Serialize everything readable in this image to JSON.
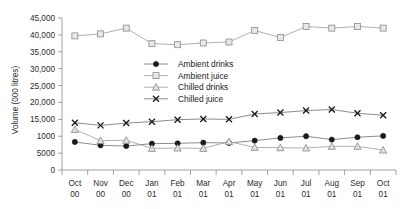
{
  "chart_data": {
    "type": "line",
    "title": "",
    "xlabel": "",
    "ylabel": "Volume (000 litres)",
    "categories": [
      "Oct 00",
      "Nov 00",
      "Dec 00",
      "Jan 01",
      "Feb 01",
      "Mar 01",
      "Apr 01",
      "May 01",
      "Jun 01",
      "Jul 01",
      "Aug 01",
      "Sep 01",
      "Oct 01"
    ],
    "category_lines": [
      [
        "Oct",
        "00"
      ],
      [
        "Nov",
        "00"
      ],
      [
        "Dec",
        "00"
      ],
      [
        "Jan",
        "01"
      ],
      [
        "Feb",
        "01"
      ],
      [
        "Mar",
        "01"
      ],
      [
        "Apr",
        "01"
      ],
      [
        "May",
        "01"
      ],
      [
        "Jun",
        "01"
      ],
      [
        "Jul",
        "01"
      ],
      [
        "Aug",
        "01"
      ],
      [
        "Sep",
        "01"
      ],
      [
        "Oct",
        "01"
      ]
    ],
    "ylim": [
      0,
      45000
    ],
    "ytick_values": [
      0,
      5000,
      10000,
      15000,
      20000,
      25000,
      30000,
      35000,
      40000,
      45000
    ],
    "ytick_labels": [
      "0",
      "5000",
      "1000",
      "15,000",
      "20,000",
      "25,000",
      "30,000",
      "35,000",
      "40,000",
      "45,000"
    ],
    "grid": false,
    "legend_position": "center",
    "series": [
      {
        "name": "Ambient drinks",
        "marker": "filled-circle",
        "color": "#1a1a1a",
        "line_color": "#6e6e6e",
        "values": [
          8300,
          7300,
          7100,
          7800,
          7900,
          8100,
          8000,
          8700,
          9500,
          10000,
          9000,
          9700,
          10100
        ]
      },
      {
        "name": "Ambient juice",
        "marker": "open-square",
        "color": "#9a9a9a",
        "line_color": "#9a9a9a",
        "values": [
          39700,
          40300,
          42000,
          37400,
          37100,
          37600,
          37900,
          41300,
          39200,
          42500,
          42000,
          42500,
          42000
        ]
      },
      {
        "name": "Chilled drinks",
        "marker": "open-triangle",
        "color": "#9a9a9a",
        "line_color": "#9a9a9a",
        "values": [
          12000,
          8700,
          8800,
          6400,
          6500,
          6400,
          8400,
          6700,
          6600,
          6500,
          7000,
          7000,
          5900
        ]
      },
      {
        "name": "Chilled juice",
        "marker": "cross",
        "color": "#1a1a1a",
        "line_color": "#6e6e6e",
        "values": [
          14000,
          13200,
          13900,
          14300,
          14900,
          15100,
          15000,
          16600,
          17000,
          17600,
          17900,
          16800,
          16200
        ]
      }
    ]
  },
  "legend": {
    "items": [
      {
        "label": "Ambient drinks"
      },
      {
        "label": "Ambient juice"
      },
      {
        "label": "Chilled drinks"
      },
      {
        "label": "Chilled juice"
      }
    ]
  }
}
